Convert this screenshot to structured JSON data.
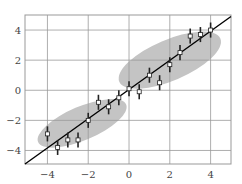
{
  "chart_data": {
    "type": "scatter",
    "title": "",
    "xlabel": "",
    "ylabel": "",
    "xlim": [
      -5.1,
      5.0
    ],
    "ylim": [
      -4.9,
      5.0
    ],
    "grid": true,
    "legend": null,
    "xticks": [
      -4,
      -2,
      0,
      2,
      4
    ],
    "yticks": [
      -4,
      -2,
      0,
      2,
      4
    ],
    "xtick_labels": [
      "−4",
      "−2",
      "0",
      "2",
      "4"
    ],
    "ytick_labels": [
      "−4",
      "−2",
      "0",
      "2",
      "4"
    ],
    "series": [
      {
        "name": "measurements",
        "style": "white square markers with vertical error bars",
        "x": [
          -4,
          -3.5,
          -3,
          -2.5,
          -2,
          -1.5,
          -1,
          -0.5,
          0,
          0.5,
          1,
          1.5,
          2,
          2.5,
          3,
          3.5,
          4
        ],
        "y": [
          -2.9,
          -3.8,
          -3.3,
          -3.3,
          -2.0,
          -0.8,
          -1.1,
          -0.5,
          0.1,
          -0.1,
          1.0,
          0.5,
          1.7,
          2.5,
          3.6,
          3.7,
          4.0
        ],
        "yerr": 0.5
      },
      {
        "name": "fit-line",
        "style": "black solid line",
        "x": [
          -5.1,
          5.0
        ],
        "y": [
          -4.9,
          4.9
        ]
      }
    ],
    "annotations": [
      {
        "type": "ellipse",
        "name": "cluster-lower",
        "center": [
          -2.3,
          -2.2
        ],
        "width": 5.4,
        "height": 1.9,
        "angle_deg": 30,
        "fill": "#c4c4c4"
      },
      {
        "type": "ellipse",
        "name": "cluster-upper",
        "center": [
          2.0,
          2.0
        ],
        "width": 6.2,
        "height": 2.3,
        "angle_deg": 30,
        "fill": "#c4c4c4"
      }
    ]
  },
  "colors": {
    "background": "#ffffff",
    "grid": "#999999",
    "frame": "#999999",
    "ellipse": "#c4c4c4",
    "line": "#000000",
    "marker_fill": "#ffffff",
    "marker_edge": "#222222"
  }
}
